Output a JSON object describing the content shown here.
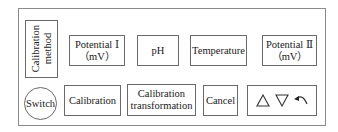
{
  "panel": {
    "calibration_method": {
      "line1": "Calibration",
      "line2": "method"
    },
    "potential_1": {
      "line1": "Potential Ⅰ",
      "line2": "（mV）"
    },
    "ph": {
      "label": "pH"
    },
    "temperature": {
      "label": "Temperature"
    },
    "potential_2": {
      "line1": "Potential Ⅱ",
      "line2": "（mV）"
    },
    "switch": {
      "label": "Switch"
    },
    "calibration": {
      "label": "Calibration"
    },
    "calibration_transformation": {
      "line1": "Calibration",
      "line2": "transformation"
    },
    "cancel": {
      "label": "Cancel"
    },
    "controls": {
      "up_icon": "triangle-up-outline",
      "down_icon": "triangle-down-outline",
      "back_icon": "return-arrow"
    }
  },
  "colors": {
    "border": "#6a6a6a",
    "frame": "#8a8a8a",
    "text": "#1a1a1a",
    "background": "#ffffff"
  }
}
